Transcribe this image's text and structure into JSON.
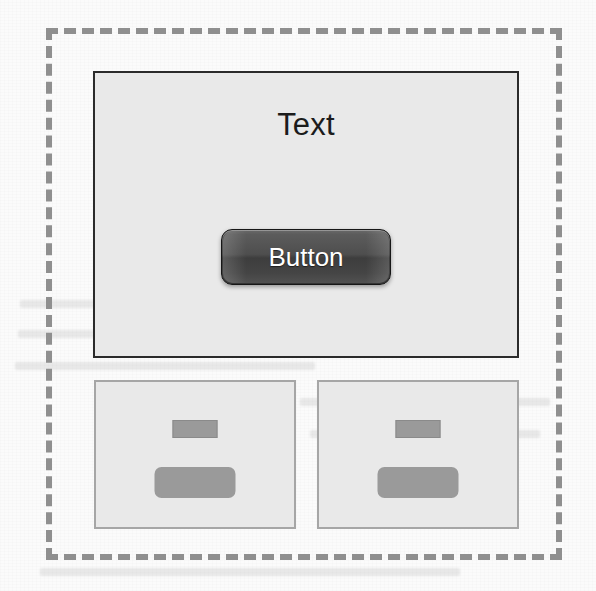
{
  "figure": {
    "kind": "ui-wireframe-diagram",
    "container": {
      "name": "dashed-selection-container",
      "border_style": "dashed",
      "border_color": "#8f8f8f"
    },
    "main_panel": {
      "name": "main-preview-panel",
      "background_color": "#e9e9e9",
      "border_color": "#2b2b2b",
      "text_label": "Text",
      "button_label": "Button",
      "button_colors": {
        "fill_top": "#6a6a6a",
        "fill_bottom": "#525252",
        "border": "#171717",
        "label_color": "#ffffff"
      }
    },
    "thumbnails": [
      {
        "name": "thumbnail-panel-left",
        "background_color": "#e9e9e9",
        "border_color": "#a6a6a6",
        "elements": [
          {
            "name": "text-placeholder",
            "shape": "rectangle",
            "fill": "#9a9a9a"
          },
          {
            "name": "button-placeholder",
            "shape": "rounded-rectangle",
            "fill": "#9a9a9a"
          }
        ]
      },
      {
        "name": "thumbnail-panel-right",
        "background_color": "#e9e9e9",
        "border_color": "#a6a6a6",
        "elements": [
          {
            "name": "text-placeholder",
            "shape": "rectangle",
            "fill": "#9a9a9a"
          },
          {
            "name": "button-placeholder",
            "shape": "rounded-rectangle",
            "fill": "#9a9a9a"
          }
        ]
      }
    ]
  }
}
